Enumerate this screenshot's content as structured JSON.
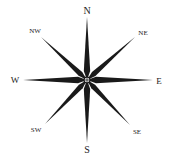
{
  "diagram": {
    "type": "compass-rose",
    "center": [
      87,
      80
    ],
    "colors": {
      "ink": "#1a1a1a",
      "label": "#222222",
      "background": "#ffffff"
    },
    "directions": [
      {
        "label": "N",
        "tip": [
          87,
          17
        ],
        "labelPos": [
          87,
          10
        ],
        "size": 10
      },
      {
        "label": "NE",
        "tip": [
          135,
          37
        ],
        "labelPos": [
          143,
          33
        ],
        "size": 7
      },
      {
        "label": "E",
        "tip": [
          153,
          80
        ],
        "labelPos": [
          159,
          81
        ],
        "size": 9
      },
      {
        "label": "SE",
        "tip": [
          130,
          125
        ],
        "labelPos": [
          137,
          132
        ],
        "size": 7
      },
      {
        "label": "S",
        "tip": [
          87,
          143
        ],
        "labelPos": [
          87,
          149
        ],
        "size": 10
      },
      {
        "label": "SW",
        "tip": [
          45,
          124
        ],
        "labelPos": [
          36,
          130
        ],
        "size": 7
      },
      {
        "label": "W",
        "tip": [
          23,
          80
        ],
        "labelPos": [
          15,
          80
        ],
        "size": 9
      },
      {
        "label": "NW",
        "tip": [
          41,
          37
        ],
        "labelPos": [
          35,
          31
        ],
        "size": 7
      }
    ]
  }
}
